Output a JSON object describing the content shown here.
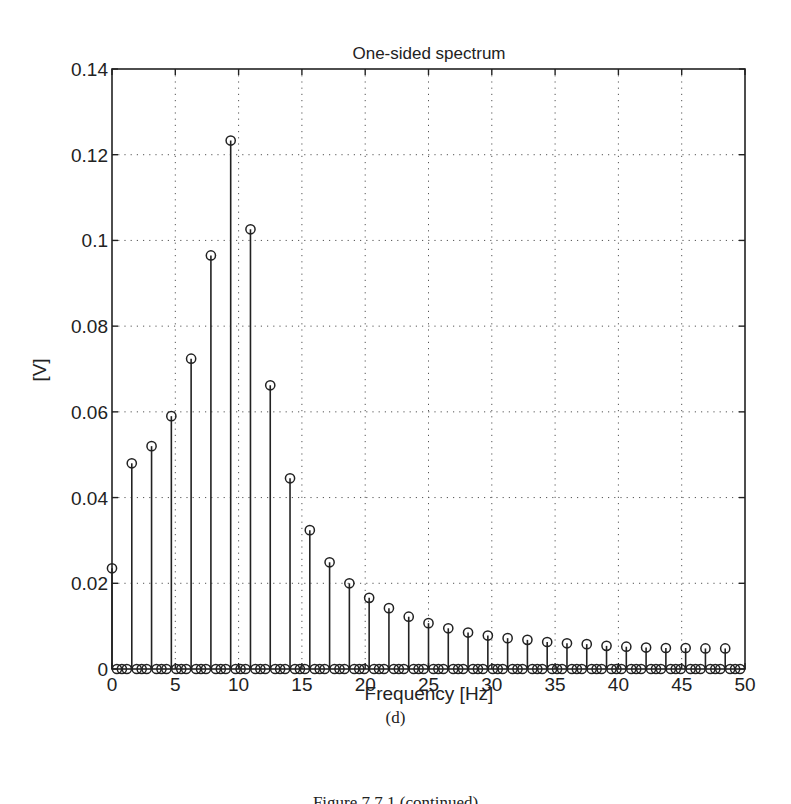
{
  "figure": {
    "subcaption": "(d)",
    "caption": "Figure 7.7.1 (continued)"
  },
  "chart_data": {
    "type": "stem",
    "title": "One-sided spectrum",
    "xlabel": "Frequency [Hz]",
    "ylabel": "[V]",
    "xlim": [
      0,
      50
    ],
    "ylim": [
      0,
      0.14
    ],
    "grid": true,
    "grid_style": "dotted",
    "marker": "circle-open",
    "xticks": [
      0,
      5,
      10,
      15,
      20,
      25,
      30,
      35,
      40,
      45,
      50
    ],
    "xtick_labels": [
      "0",
      "5",
      "10",
      "15",
      "20",
      "25",
      "30",
      "35",
      "40",
      "45",
      "50"
    ],
    "yticks": [
      0,
      0.02,
      0.04,
      0.06,
      0.08,
      0.1,
      0.12,
      0.14
    ],
    "ytick_labels": [
      "0",
      "0.02",
      "0.04",
      "0.06",
      "0.08",
      "0.1",
      "0.12",
      "0.14"
    ],
    "sample_spacing_hz": 0.390625,
    "num_points": 128,
    "nonzero_every": 4,
    "nonzero_points": {
      "x": [
        0,
        1.5625,
        3.125,
        4.6875,
        6.25,
        7.8125,
        9.375,
        10.9375,
        12.5,
        14.0625,
        15.625,
        17.1875,
        18.75,
        20.3125,
        21.875,
        23.4375,
        25.0,
        26.5625,
        28.125,
        29.6875,
        31.25,
        32.8125,
        34.375,
        35.9375,
        37.5,
        39.0625,
        40.625,
        42.1875,
        43.75,
        45.3125,
        46.875,
        48.4375
      ],
      "y": [
        0.0235,
        0.048,
        0.052,
        0.059,
        0.0724,
        0.0965,
        0.1233,
        0.1026,
        0.0662,
        0.0445,
        0.0324,
        0.0249,
        0.02,
        0.0166,
        0.0142,
        0.0122,
        0.0107,
        0.0095,
        0.0085,
        0.0078,
        0.0072,
        0.0068,
        0.0063,
        0.006,
        0.0058,
        0.0054,
        0.0052,
        0.005,
        0.0049,
        0.0049,
        0.0048,
        0.0048
      ]
    },
    "note": "All other points (indices not multiple of 4) have value 0"
  }
}
